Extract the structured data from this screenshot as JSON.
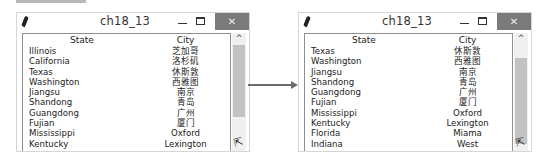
{
  "windows": [
    {
      "title": "ch18_13",
      "controls": {
        "minimize": "—",
        "maximize": "☐",
        "close": "✕"
      },
      "columns": [
        "State",
        "City"
      ],
      "rows": [
        {
          "state": "Illinois",
          "city": "芝加哥"
        },
        {
          "state": "California",
          "city": "洛杉矶"
        },
        {
          "state": "Texas",
          "city": "休斯敦"
        },
        {
          "state": "Washington",
          "city": "西雅图"
        },
        {
          "state": "Jiangsu",
          "city": "南京"
        },
        {
          "state": "Shandong",
          "city": "青岛"
        },
        {
          "state": "Guangdong",
          "city": "广州"
        },
        {
          "state": "Fujian",
          "city": "厦门"
        },
        {
          "state": "Mississippi",
          "city": "Oxford"
        },
        {
          "state": "Kentucky",
          "city": "Lexington"
        }
      ],
      "scrollbar": {
        "up_arrow": "^",
        "thumb_top": 12,
        "thumb_height": 72
      }
    },
    {
      "title": "ch18_13",
      "controls": {
        "minimize": "—",
        "maximize": "☐",
        "close": "✕"
      },
      "columns": [
        "State",
        "City"
      ],
      "rows": [
        {
          "state": "Texas",
          "city": "休斯敦"
        },
        {
          "state": "Washington",
          "city": "西雅图"
        },
        {
          "state": "Jiangsu",
          "city": "南京"
        },
        {
          "state": "Shandong",
          "city": "青岛"
        },
        {
          "state": "Guangdong",
          "city": "广州"
        },
        {
          "state": "Fujian",
          "city": "厦门"
        },
        {
          "state": "Mississippi",
          "city": "Oxford"
        },
        {
          "state": "Kentucky",
          "city": "Lexington"
        },
        {
          "state": "Florida",
          "city": "Miama"
        },
        {
          "state": "Indiana",
          "city": "West"
        }
      ],
      "scrollbar": {
        "up_arrow": "^",
        "thumb_top": 25,
        "thumb_height": 86
      }
    }
  ],
  "icons": {
    "app": "feather-icon",
    "cursor": "⇱",
    "arrow": "right-arrow-icon"
  }
}
